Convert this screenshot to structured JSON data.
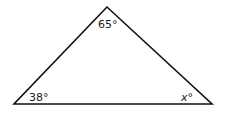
{
  "diagram": {
    "type": "triangle",
    "stroke_color": "#111111",
    "vertices": {
      "top": {
        "x": 107,
        "y": 7
      },
      "bottom_left": {
        "x": 14,
        "y": 104
      },
      "bottom_right": {
        "x": 212,
        "y": 104
      }
    },
    "angles": {
      "top": "65°",
      "bottom_left": "38°",
      "bottom_right_var": "x",
      "bottom_right_deg": "°"
    }
  }
}
